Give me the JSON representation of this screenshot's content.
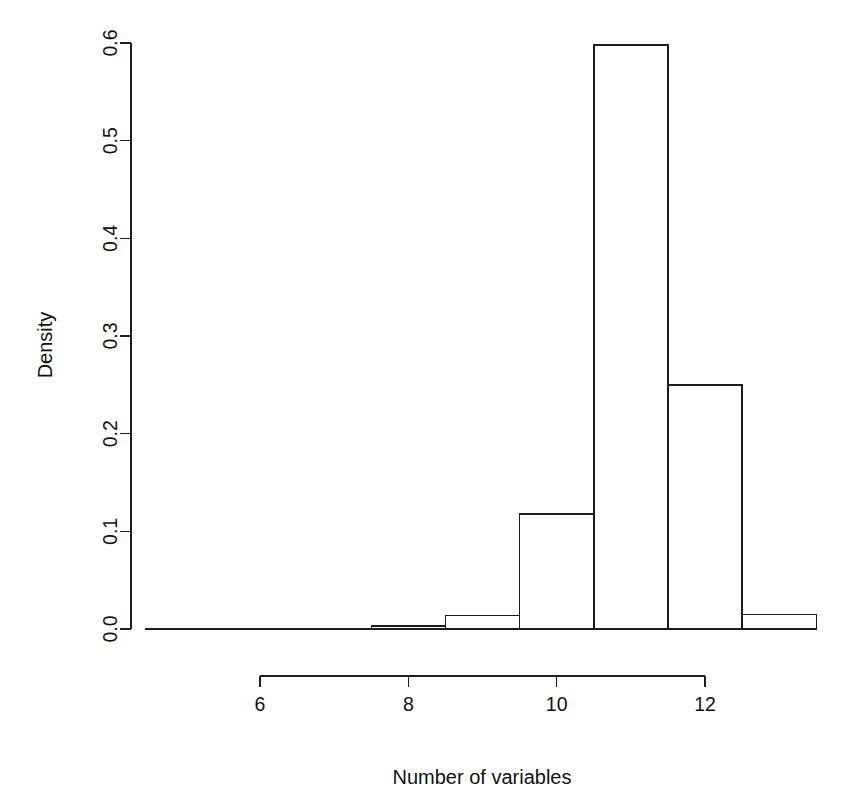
{
  "chart_data": {
    "type": "bar",
    "title": "",
    "subtitle": "",
    "xlabel": "Number of variables",
    "ylabel": "Density",
    "xlim": [
      6.4,
      13.7
    ],
    "ylim": [
      0.0,
      0.6
    ],
    "grid": false,
    "legend": false,
    "legend_position": "none",
    "annotations": [],
    "bin_width": 1,
    "bin_edges": [
      7.5,
      8.5,
      9.5,
      10.5,
      11.5,
      12.5,
      13.5
    ],
    "categories": [
      "7.5-8.5",
      "8.5-9.5",
      "9.5-10.5",
      "10.5-11.5",
      "11.5-12.5",
      "12.5-13.5"
    ],
    "values": [
      0.003,
      0.014,
      0.118,
      0.598,
      0.25,
      0.015
    ],
    "bars": [
      {
        "x0": 7.5,
        "x1": 8.5,
        "density": 0.003
      },
      {
        "x0": 8.5,
        "x1": 9.5,
        "density": 0.014
      },
      {
        "x0": 9.5,
        "x1": 10.5,
        "density": 0.118
      },
      {
        "x0": 10.5,
        "x1": 11.5,
        "density": 0.598
      },
      {
        "x0": 11.5,
        "x1": 12.5,
        "density": 0.25
      },
      {
        "x0": 12.5,
        "x1": 13.5,
        "density": 0.015
      }
    ],
    "x_ticks": [
      6,
      8,
      10,
      12
    ],
    "x_tick_labels": [
      "6",
      "8",
      "10",
      "12"
    ],
    "y_ticks": [
      0.0,
      0.1,
      0.2,
      0.3,
      0.4,
      0.5,
      0.6
    ],
    "y_tick_labels": [
      "0.0",
      "0.1",
      "0.2",
      "0.3",
      "0.4",
      "0.5",
      "0.6"
    ],
    "colors": {
      "axis": "#1d1d1d",
      "bar_fill": "#ffffff",
      "bar_stroke": "#1d1d1d",
      "background": "#ffffff",
      "text": "#111111"
    }
  }
}
